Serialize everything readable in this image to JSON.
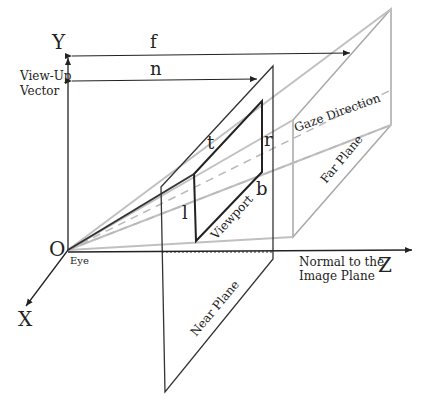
{
  "diagram": {
    "axes": {
      "y": "Y",
      "z": "Z",
      "x": "X",
      "origin": "O"
    },
    "labels": {
      "view_up": "View-Up",
      "vector": "Vector",
      "eye": "Eye",
      "f": "f",
      "n": "n",
      "t": "t",
      "r": "r",
      "l": "l",
      "b": "b",
      "viewport": "Viewport",
      "gaze_direction": "Gaze Direction",
      "far_plane": "Far Plane",
      "near_plane": "Near Plane",
      "normal_line1": "Normal to the",
      "normal_line2": "Image Plane"
    },
    "colors": {
      "axis": "#222222",
      "frustum": "#b8b8b8",
      "far_plane": "#9a9a9a",
      "near_plane": "#333333",
      "dashed": "#b0b0b0"
    }
  }
}
